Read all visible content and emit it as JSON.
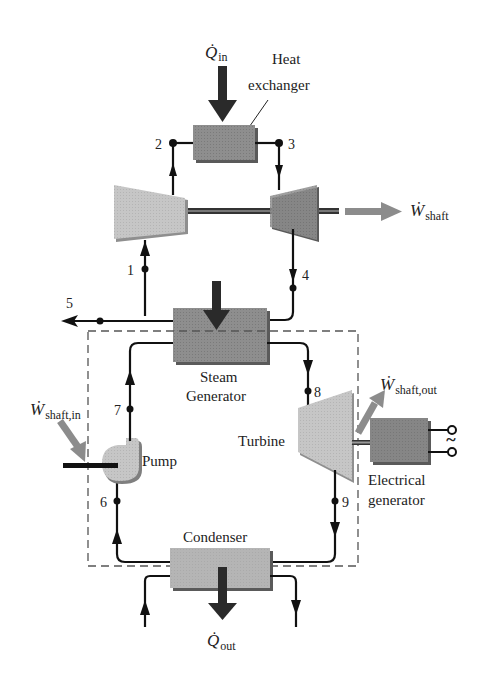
{
  "colors": {
    "line": "#111111",
    "component_dark": "#8a8a8a",
    "component_light": "#c4c4c4",
    "component_shadow": "#5a5a5a",
    "work_arrow": "#8c8c8c",
    "dashed_boundary": "#555555"
  },
  "labels": {
    "heat_exchanger_line1": "Heat",
    "heat_exchanger_line2": "exchanger",
    "steam_generator_line1": "Steam",
    "steam_generator_line2": "Generator",
    "turbine": "Turbine",
    "pump": "Pump",
    "condenser": "Condenser",
    "electrical_generator_line1": "Electrical",
    "electrical_generator_line2": "generator",
    "ac_symbol": "~"
  },
  "symbols": {
    "q_in": {
      "main": "Q̇",
      "sub": "in"
    },
    "q_out": {
      "main": "Q̇",
      "sub": "out"
    },
    "w_shaft": {
      "main": "Ẇ",
      "sub": "shaft"
    },
    "w_shaft_in": {
      "main": "Ẇ",
      "sub": "shaft,in"
    },
    "w_shaft_out": {
      "main": "Ẇ",
      "sub": "shaft,out"
    }
  },
  "state_points": [
    "1",
    "2",
    "3",
    "4",
    "5",
    "6",
    "7",
    "8",
    "9"
  ]
}
